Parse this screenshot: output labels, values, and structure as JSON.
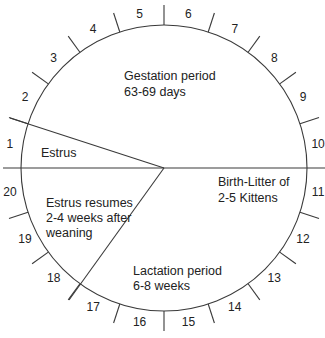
{
  "diagram": {
    "type": "circular-cycle",
    "sector_count": 20,
    "sector_numbers": [
      "1",
      "2",
      "3",
      "4",
      "5",
      "6",
      "7",
      "8",
      "9",
      "10",
      "11",
      "12",
      "13",
      "14",
      "15",
      "16",
      "17",
      "18",
      "19",
      "20"
    ],
    "colors": {
      "line": "#3a3a3a",
      "text": "#222222",
      "background": "#ffffff"
    },
    "regions": {
      "estrus": {
        "lines": [
          "Estrus"
        ],
        "sectors": "1"
      },
      "gestation": {
        "lines": [
          "Gestation period",
          "63-69  days"
        ],
        "sectors": "2-10"
      },
      "birth": {
        "lines": [
          "Birth-Litter of",
          "2-5 Kittens"
        ],
        "sectors": "10/11 boundary"
      },
      "lactation": {
        "lines": [
          "Lactation period",
          "6-8  weeks"
        ],
        "sectors": "11-17"
      },
      "estrus_resumes": {
        "lines": [
          "Estrus  resumes",
          "2-4  weeks  after",
          "weaning"
        ],
        "sectors": "18-20"
      }
    }
  }
}
